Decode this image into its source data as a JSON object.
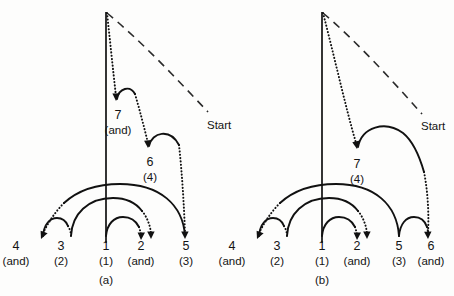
{
  "figure": {
    "background_color": "#fdfdfc",
    "ink_color": "#111111",
    "panels": [
      {
        "id": "a",
        "caption": "(a)",
        "start_label": "Start",
        "nodes": [
          {
            "number": "4",
            "sub": "(and)"
          },
          {
            "number": "3",
            "sub": "(2)"
          },
          {
            "number": "1",
            "sub": "(1)"
          },
          {
            "number": "2",
            "sub": "(and)"
          },
          {
            "number": "5",
            "sub": "(3)"
          },
          {
            "number": "7",
            "sub": "(and)"
          },
          {
            "number": "6",
            "sub": "(4)"
          }
        ]
      },
      {
        "id": "b",
        "caption": "(b)",
        "start_label": "Start",
        "nodes": [
          {
            "number": "4",
            "sub": "(and)"
          },
          {
            "number": "3",
            "sub": "(2)"
          },
          {
            "number": "1",
            "sub": "(1)"
          },
          {
            "number": "2",
            "sub": "(and)"
          },
          {
            "number": "5",
            "sub": "(3)"
          },
          {
            "number": "6",
            "sub": "(and)"
          },
          {
            "number": "7",
            "sub": "(4)"
          }
        ]
      }
    ]
  }
}
